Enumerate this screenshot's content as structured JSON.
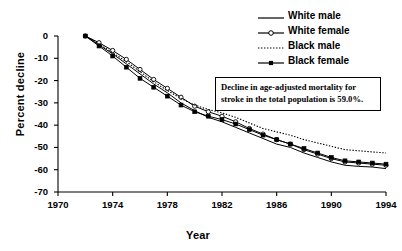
{
  "chart_data": {
    "type": "line",
    "title": "",
    "xlabel": "Year",
    "ylabel": "Percent decline",
    "xlim": [
      1970,
      1994
    ],
    "ylim": [
      -70,
      0
    ],
    "xticks": [
      1970,
      1974,
      1978,
      1982,
      1986,
      1990,
      1994
    ],
    "yticks": [
      0,
      -10,
      -20,
      -30,
      -40,
      -50,
      -60,
      -70
    ],
    "ytick_labels": [
      "0",
      "-10",
      "-20",
      "-30",
      "-40",
      "-50",
      "-60",
      "-70"
    ],
    "xtick_labels": [
      "1970",
      "1974",
      "1978",
      "1982",
      "1986",
      "1990",
      "1994"
    ],
    "grid": false,
    "legend_position": "top-right",
    "x": [
      1972,
      1973,
      1974,
      1975,
      1976,
      1977,
      1978,
      1979,
      1980,
      1981,
      1982,
      1983,
      1984,
      1985,
      1986,
      1987,
      1988,
      1989,
      1990,
      1991,
      1992,
      1993,
      1994
    ],
    "series": [
      {
        "name": "White male",
        "marker": "none",
        "line": "solid",
        "color": "#000000",
        "values": [
          0,
          -4.0,
          -8.0,
          -12.5,
          -17.0,
          -21.5,
          -25.5,
          -30.0,
          -33.5,
          -36.5,
          -38.5,
          -41.0,
          -43.5,
          -46.0,
          -48.5,
          -50.0,
          -52.5,
          -54.5,
          -56.5,
          -58.0,
          -58.5,
          -58.8,
          -59.5
        ]
      },
      {
        "name": "White female",
        "marker": "open-circle",
        "line": "solid",
        "color": "#000000",
        "values": [
          0,
          -3.0,
          -6.5,
          -10.5,
          -15.0,
          -19.5,
          -23.5,
          -27.5,
          -31.5,
          -34.0,
          -36.0,
          -38.5,
          -41.5,
          -44.0,
          -46.5,
          -48.5,
          -51.0,
          -53.0,
          -55.0,
          -56.5,
          -57.0,
          -57.5,
          -58.0
        ]
      },
      {
        "name": "Black male",
        "marker": "none",
        "line": "dotted",
        "color": "#000000",
        "values": [
          0,
          -3.5,
          -7.5,
          -11.5,
          -16.0,
          -20.5,
          -24.5,
          -28.0,
          -31.0,
          -33.0,
          -34.5,
          -36.5,
          -39.0,
          -41.5,
          -43.0,
          -44.5,
          -46.5,
          -48.0,
          -49.5,
          -51.0,
          -51.5,
          -52.0,
          -52.5
        ]
      },
      {
        "name": "Black female",
        "marker": "filled-square",
        "line": "solid",
        "color": "#000000",
        "values": [
          0,
          -4.5,
          -9.0,
          -14.0,
          -19.0,
          -23.0,
          -27.0,
          -31.0,
          -34.0,
          -36.0,
          -37.5,
          -39.5,
          -42.0,
          -44.5,
          -46.5,
          -48.5,
          -50.5,
          -52.5,
          -54.5,
          -56.0,
          -56.5,
          -57.0,
          -57.5
        ]
      }
    ],
    "annotation": {
      "line1": "Decline in age-adjusted mortality for",
      "line2": "stroke in the total population is 59.0%."
    }
  }
}
